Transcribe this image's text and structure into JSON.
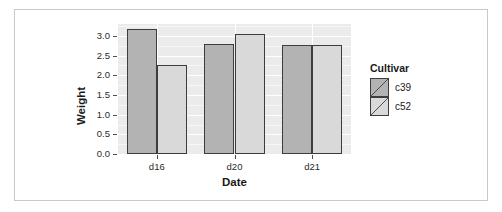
{
  "chart_data": {
    "type": "bar",
    "title": "",
    "subtitle": "",
    "xlabel": "Date",
    "ylabel": "Weight",
    "categories": [
      "d16",
      "d20",
      "d21"
    ],
    "series": [
      {
        "name": "c39",
        "values": [
          3.18,
          2.8,
          2.78
        ],
        "color": "#b3b3b3"
      },
      {
        "name": "c52",
        "values": [
          2.25,
          3.05,
          2.78
        ],
        "color": "#d9d9d9"
      }
    ],
    "ylim": [
      0.0,
      3.3
    ],
    "yticks": [
      "0.0",
      "0.5",
      "1.0",
      "1.5",
      "2.0",
      "2.5",
      "3.0"
    ],
    "ytick_values": [
      0.0,
      0.5,
      1.0,
      1.5,
      2.0,
      2.5,
      3.0
    ],
    "xticks": [
      "d16",
      "d20",
      "d21"
    ],
    "grid": true,
    "legend_position": "right",
    "legend_title": "Cultivar",
    "bar_mode": "dodge",
    "panel_background": "#ebebeb",
    "gridline_color": "#ffffff",
    "bar_outline_color": "#3d3d3d"
  },
  "legend": {
    "title": "Cultivar",
    "entries": [
      {
        "label": "c39",
        "color": "#b3b3b3"
      },
      {
        "label": "c52",
        "color": "#d9d9d9"
      }
    ]
  },
  "axes": {
    "y_title": "Weight",
    "x_title": "Date"
  }
}
